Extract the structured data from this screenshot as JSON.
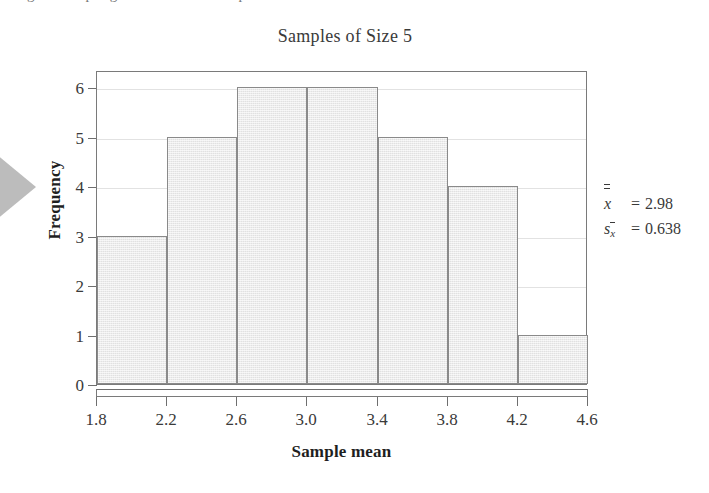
{
  "page": {
    "caption_sliver": "Figure    Sampling distribution of sample means",
    "background": "#ffffff"
  },
  "chart_data": {
    "type": "bar",
    "title": "Samples of Size 5",
    "xlabel": "Sample mean",
    "ylabel": "Frequency",
    "categories": [
      "1.8–2.2",
      "2.2–2.6",
      "2.6–3.0",
      "3.0–3.4",
      "3.4–3.8",
      "3.8–4.2",
      "4.2–4.6"
    ],
    "bin_edges": [
      1.8,
      2.2,
      2.6,
      3.0,
      3.4,
      3.8,
      4.2,
      4.6
    ],
    "values": [
      3,
      5,
      6,
      6,
      5,
      4,
      1
    ],
    "bin_width": 0.4,
    "xticks": [
      "1.8",
      "2.2",
      "2.6",
      "3.0",
      "3.4",
      "3.8",
      "4.2",
      "4.6"
    ],
    "xtick_values": [
      1.8,
      2.2,
      2.6,
      3.0,
      3.4,
      3.8,
      4.2,
      4.6
    ],
    "yticks": [
      "0",
      "1",
      "2",
      "3",
      "4",
      "5",
      "6"
    ],
    "ytick_values": [
      0,
      1,
      2,
      3,
      4,
      5,
      6
    ],
    "xlim": [
      1.8,
      4.6
    ],
    "ylim": [
      0,
      6.35
    ],
    "grid": "horizontal",
    "legend": "none",
    "bar_fill": "#e9e9e9",
    "bar_border": "#8a8a8a",
    "grid_color": "#e2e2e2",
    "axis_color": "#7a7a7a",
    "total_count": 30
  },
  "annotations": {
    "mean": {
      "symbol": "x",
      "symbol_note": "x-double-bar",
      "equals": "=",
      "value": "2.98"
    },
    "std_error": {
      "symbol": "s",
      "subscript": "x",
      "subscript_note": "x-bar subscript",
      "equals": "=",
      "value": "0.638"
    }
  },
  "decor": {
    "margin_arrow": "right-arrow-marker",
    "margin_arrow_color": "#b9b9b9"
  }
}
